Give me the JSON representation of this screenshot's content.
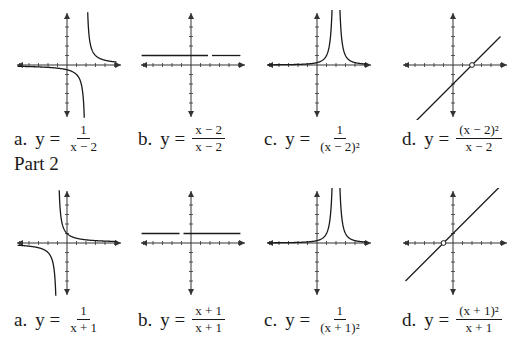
{
  "parts": [
    {
      "title": "",
      "graphs": [
        {
          "letter": "a.",
          "yeq": "y =",
          "num": "1",
          "den": "x − 2",
          "type": "reciprocal",
          "shift": 2
        },
        {
          "letter": "b.",
          "yeq": "y =",
          "num": "x − 2",
          "den": "x − 2",
          "type": "constant-hole",
          "shift": 2
        },
        {
          "letter": "c.",
          "yeq": "y =",
          "num": "1",
          "den": "(x − 2)²",
          "type": "reciprocal-square",
          "shift": 2
        },
        {
          "letter": "d.",
          "yeq": "y =",
          "num": "(x − 2)²",
          "den": "x − 2",
          "type": "line-hole",
          "shift": 2
        }
      ]
    },
    {
      "title": "Part 2",
      "graphs": [
        {
          "letter": "a.",
          "yeq": "y =",
          "num": "1",
          "den": "x + 1",
          "type": "reciprocal",
          "shift": -1
        },
        {
          "letter": "b.",
          "yeq": "y =",
          "num": "x + 1",
          "den": "x + 1",
          "type": "constant-hole",
          "shift": -1
        },
        {
          "letter": "c.",
          "yeq": "y =",
          "num": "1",
          "den": "(x + 1)²",
          "type": "reciprocal-square",
          "shift": 2
        },
        {
          "letter": "d.",
          "yeq": "y =",
          "num": "(x + 1)²",
          "den": "x + 1",
          "type": "line-hole",
          "shift": -1
        }
      ]
    }
  ],
  "colors": {
    "ink": "#1a1a1a",
    "axis": "#333333",
    "background": "#ffffff"
  }
}
